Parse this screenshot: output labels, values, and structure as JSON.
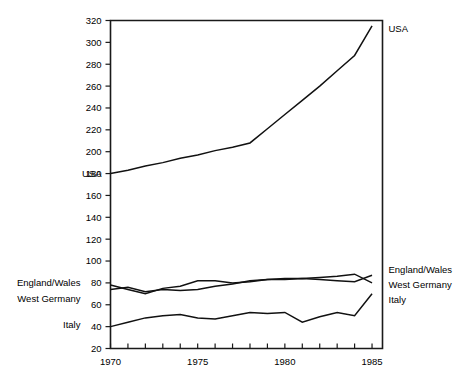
{
  "chart_data": {
    "type": "line",
    "title": "",
    "xlabel": "",
    "ylabel": "",
    "xlim": [
      1970,
      1985.6
    ],
    "ylim": [
      20,
      320
    ],
    "grid": false,
    "legend_position": "inline-end-labels",
    "y_ticks": [
      20,
      40,
      60,
      80,
      100,
      120,
      140,
      160,
      180,
      200,
      220,
      240,
      260,
      280,
      300,
      320
    ],
    "x_ticks": [
      1970,
      1971,
      1972,
      1973,
      1974,
      1975,
      1976,
      1977,
      1978,
      1979,
      1980,
      1981,
      1982,
      1983,
      1984,
      1985
    ],
    "x_tick_labels": [
      "1970",
      "",
      "",
      "",
      "",
      "1975",
      "",
      "",
      "",
      "",
      "1980",
      "",
      "",
      "",
      "",
      "1985"
    ],
    "x": [
      1970,
      1971,
      1972,
      1973,
      1974,
      1975,
      1976,
      1977,
      1978,
      1979,
      1980,
      1981,
      1982,
      1983,
      1984,
      1985
    ],
    "series": [
      {
        "name": "USA",
        "label_left": "USA",
        "label_right": "USA",
        "values": [
          180,
          183,
          187,
          190,
          194,
          197,
          201,
          204,
          208,
          221,
          234,
          247,
          260,
          274,
          288,
          315
        ]
      },
      {
        "name": "England/Wales",
        "label_left": "England/Wales",
        "label_right": "England/Wales",
        "values": [
          78,
          74,
          70,
          75,
          77,
          82,
          82,
          80,
          81,
          83,
          84,
          84,
          85,
          86,
          88,
          80
        ]
      },
      {
        "name": "West Germany",
        "label_left": "West Germany",
        "label_right": "West Germany",
        "values": [
          74,
          76,
          72,
          74,
          73,
          74,
          77,
          79,
          82,
          83,
          83,
          84,
          83,
          82,
          81,
          87
        ]
      },
      {
        "name": "Italy",
        "label_left": "Italy",
        "label_right": "Italy",
        "values": [
          40,
          44,
          48,
          50,
          51,
          48,
          47,
          50,
          53,
          52,
          53,
          44,
          49,
          53,
          50,
          70
        ]
      }
    ]
  },
  "left_labels": {
    "usa": "USA",
    "england_wales": "England/Wales",
    "west_germany": "West Germany",
    "italy": "Italy"
  },
  "right_labels": {
    "usa": "USA",
    "england_wales": "England/Wales",
    "west_germany": "West Germany",
    "italy": "Italy"
  }
}
